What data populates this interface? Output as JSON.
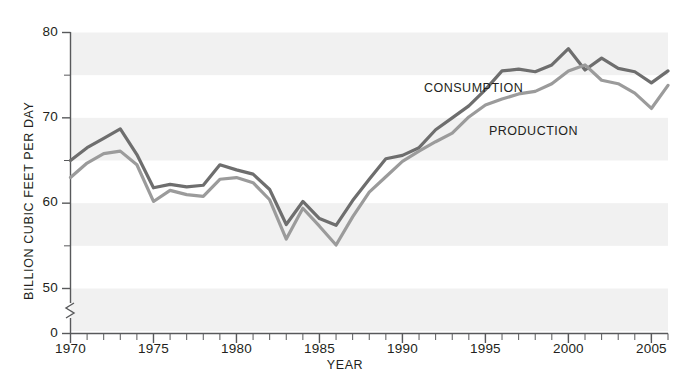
{
  "chart_data": {
    "type": "line",
    "title": "",
    "xlabel": "YEAR",
    "ylabel": "BILLION CUBIC FEET PER DAY",
    "xlim": [
      1970,
      2006
    ],
    "ylim": [
      45,
      80
    ],
    "y_axis_break": true,
    "y_break_below": 45,
    "grid": false,
    "banding": "alternating horizontal bands every 5 units",
    "band_color": "#f1f1f1",
    "background": "#ffffff",
    "legend_position": "inline-annotations",
    "x_major_ticks": [
      1970,
      1975,
      1980,
      1985,
      1990,
      1995,
      2000,
      2005
    ],
    "x_minor_tick_interval": 1,
    "y_major_ticks": [
      0,
      50,
      60,
      70,
      80
    ],
    "y_minor_ticks": [
      55,
      65,
      75
    ],
    "x_tick_labels": [
      "1970",
      "1975",
      "1980",
      "1985",
      "1990",
      "1995",
      "2000",
      "2005"
    ],
    "y_tick_labels": [
      "80",
      "70",
      "60",
      "50",
      "0"
    ],
    "x": [
      1970,
      1971,
      1972,
      1973,
      1974,
      1975,
      1976,
      1977,
      1978,
      1979,
      1980,
      1981,
      1982,
      1983,
      1984,
      1985,
      1986,
      1987,
      1988,
      1989,
      1990,
      1991,
      1992,
      1993,
      1994,
      1995,
      1996,
      1997,
      1998,
      1999,
      2000,
      2001,
      2002,
      2003,
      2004,
      2005,
      2006
    ],
    "series": [
      {
        "name": "CONSUMPTION",
        "color": "#6e6e6e",
        "values": [
          65.0,
          66.5,
          67.6,
          68.7,
          65.7,
          61.8,
          62.2,
          61.9,
          62.1,
          64.5,
          63.9,
          63.4,
          61.6,
          57.5,
          60.2,
          58.2,
          57.4,
          60.3,
          62.8,
          65.2,
          65.6,
          66.5,
          68.6,
          70.0,
          71.4,
          73.3,
          75.5,
          75.7,
          75.4,
          76.2,
          78.1,
          75.6,
          77.0,
          75.8,
          75.4,
          74.1,
          75.5
        ]
      },
      {
        "name": "PRODUCTION",
        "color": "#9b9b9b",
        "values": [
          63.0,
          64.7,
          65.8,
          66.1,
          64.5,
          60.2,
          61.5,
          61.0,
          60.8,
          62.8,
          63.0,
          62.4,
          60.4,
          55.8,
          59.4,
          57.3,
          55.1,
          58.4,
          61.3,
          63.1,
          64.9,
          66.1,
          67.2,
          68.2,
          70.1,
          71.5,
          72.2,
          72.8,
          73.1,
          74.0,
          75.5,
          76.2,
          74.4,
          74.0,
          72.9,
          71.1,
          73.8
        ]
      }
    ]
  },
  "annotations": {
    "consumption_label": "CONSUMPTION",
    "production_label": "PRODUCTION"
  },
  "axes": {
    "x_title": "YEAR",
    "y_title": "BILLION CUBIC FEET PER DAY"
  }
}
